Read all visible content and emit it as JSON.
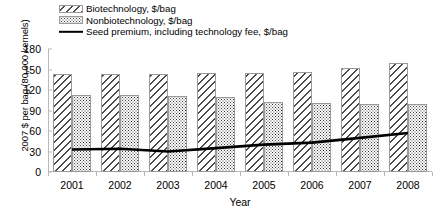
{
  "chart_data": {
    "type": "bar",
    "title": "",
    "xlabel": "Year",
    "ylabel": "2007 $ per bag (80,000 kernels)",
    "categories": [
      "2001",
      "2002",
      "2003",
      "2004",
      "2005",
      "2006",
      "2007",
      "2008"
    ],
    "ylim": [
      0,
      180
    ],
    "yticks": [
      0,
      30,
      60,
      90,
      120,
      150,
      180
    ],
    "ytick_labels": [
      "0",
      "30",
      "60",
      "90",
      "120",
      "150",
      "180"
    ],
    "grid": false,
    "legend_position": "top-left",
    "series": [
      {
        "name": "Biotechnology, $/bag",
        "render": "bar",
        "pattern": "diagonal-hatch",
        "color": "#4a4a4a",
        "values": [
          143,
          143,
          143,
          145,
          145,
          147,
          152,
          160
        ]
      },
      {
        "name": "Nonbiotechnology, $/bag",
        "render": "bar",
        "pattern": "dotted-stipple",
        "color": "#3a3a3a",
        "values": [
          112,
          112,
          111,
          110,
          103,
          101,
          100,
          99
        ]
      },
      {
        "name": "Seed premium, including technology fee, $/bag",
        "render": "line",
        "pattern": "solid",
        "color": "#000000",
        "values": [
          33,
          34,
          30,
          35,
          40,
          43,
          50,
          57
        ]
      }
    ]
  },
  "legend": {
    "items": [
      {
        "label": "Biotechnology, $/bag",
        "swatch": "biotech"
      },
      {
        "label": "Nonbiotechnology, $/bag",
        "swatch": "nonbiotech"
      },
      {
        "label": "Seed premium, including technology fee, $/bag",
        "swatch": "line"
      }
    ]
  }
}
